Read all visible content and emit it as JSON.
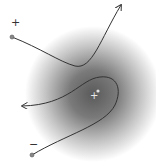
{
  "diagram": {
    "field": {
      "center": [
        93,
        94
      ],
      "radius": 68,
      "inner_color": "#5a5a5a",
      "outer_color": "#ffffff"
    },
    "central_charge": {
      "label": "+",
      "position": [
        93,
        96
      ],
      "dot_position": [
        98,
        91
      ],
      "color": "#e8e8e8"
    },
    "particles": [
      {
        "name": "positive-particle",
        "label": "+",
        "label_position": [
          11,
          22
        ],
        "start": [
          12,
          36
        ],
        "path": "M12,37 C40,48 60,62 75,66 C92,70 100,40 121,5",
        "arrow_tip": [
          121,
          5
        ]
      },
      {
        "name": "negative-particle",
        "label": "−",
        "label_position": [
          28,
          139
        ],
        "start": [
          32,
          155
        ],
        "path": "M32,155 C65,135 105,125 115,105 C122,90 118,75 100,77 C80,79 78,105 22,106",
        "arrow_tip": [
          22,
          106
        ]
      }
    ],
    "line_color": "#333333",
    "dot_color": "#888888"
  }
}
